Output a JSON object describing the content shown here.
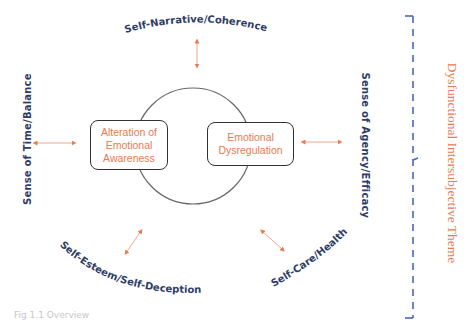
{
  "diagram": {
    "core_circle": {
      "stroke": "#555555"
    },
    "core_boxes": [
      {
        "label": "Alteration of Emotional Awareness",
        "lines": [
          "Alteration of",
          "Emotional",
          "Awareness"
        ]
      },
      {
        "label": "Emotional Dysregulation",
        "lines": [
          "Emotional",
          "Dysregulation"
        ]
      }
    ],
    "outer_themes": [
      {
        "label": "Self-Narrative/Coherence",
        "position": "top"
      },
      {
        "label": "Sense of Time/Balance",
        "position": "left"
      },
      {
        "label": "Sense of Agency/Efficacy",
        "position": "right"
      },
      {
        "label": "Self-Esteem/Self-Deception",
        "position": "bottom-left"
      },
      {
        "label": "Self-Care/Health",
        "position": "bottom-right"
      }
    ],
    "bracket_label": "Dysfunctional Intersubjective Theme",
    "footer_text": "Fig 1.1 Overview",
    "colors": {
      "accent_orange": "#ea7a4f",
      "navy_text": "#2f3d66",
      "bracket_blue": "#4a67b8"
    }
  }
}
